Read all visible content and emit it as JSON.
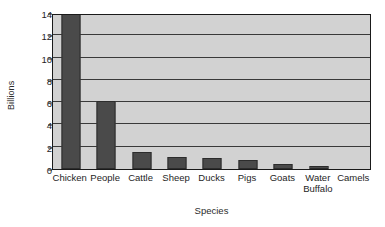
{
  "chart_data": {
    "type": "bar",
    "title": "",
    "xlabel": "Species",
    "ylabel": "Billions",
    "categories": [
      "Chicken",
      "People",
      "Cattle",
      "Sheep",
      "Ducks",
      "Pigs",
      "Goats",
      "Water Buffalo",
      "Camels"
    ],
    "values": [
      14.0,
      6.1,
      1.5,
      1.05,
      0.95,
      0.8,
      0.45,
      0.25,
      0.0
    ],
    "ylim": [
      0,
      14
    ],
    "yticks": [
      0,
      2,
      4,
      6,
      8,
      10,
      12,
      14
    ],
    "ytick_labels": [
      "0",
      "2",
      "4",
      "6",
      "8",
      "10",
      "12",
      "14"
    ],
    "grid": true,
    "grid_axis": "y",
    "legend": false,
    "legend_position": "none",
    "bar_color": "#4a4a4a",
    "plot_background": "#d2d2d2",
    "figure_background": "#ffffff",
    "axis_color": "#1a1a1a"
  }
}
